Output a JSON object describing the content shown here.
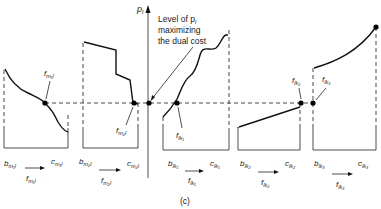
{
  "figure": {
    "caption": "(c)",
    "axis_label": "p",
    "axis_label_sub": "l",
    "annotation": [
      "Level of p",
      "maximizing",
      "the dual cost"
    ],
    "annotation_sub": "l",
    "panels": [
      {
        "id": "m1l",
        "b_label": "b",
        "b_sub": "m₁l",
        "c_label": "c",
        "c_sub": "m₁l",
        "flow_label": "f",
        "flow_sub": "m₁l",
        "point_label": "f",
        "point_sub": "m₁l",
        "shape": "decreasing-curve"
      },
      {
        "id": "m2l",
        "b_label": "b",
        "b_sub": "m₂l",
        "c_label": "c",
        "c_sub": "m₂l",
        "flow_label": "f",
        "flow_sub": "m₂l",
        "point_label": "f",
        "point_sub": "m₂l",
        "shape": "decreasing-step"
      },
      {
        "id": "lk1",
        "b_label": "b",
        "b_sub": "lk₁",
        "c_label": "c",
        "c_sub": "lk₁",
        "flow_label": "f",
        "flow_sub": "lk₁",
        "point_label": "f",
        "point_sub": "lk₁",
        "shape": "increasing-wavy"
      },
      {
        "id": "lk2",
        "b_label": "b",
        "b_sub": "lk₂",
        "c_label": "c",
        "c_sub": "lk₂",
        "flow_label": "f",
        "flow_sub": "lk₂",
        "point_label": "f",
        "point_sub": "lk₂",
        "shape": "increasing-linear"
      },
      {
        "id": "lk3",
        "b_label": "b",
        "b_sub": "lk₃",
        "c_label": "c",
        "c_sub": "lk₃",
        "flow_label": "f",
        "flow_sub": "lk₃",
        "point_label": "f",
        "point_sub": "lk₃",
        "shape": "increasing-convex"
      }
    ]
  }
}
